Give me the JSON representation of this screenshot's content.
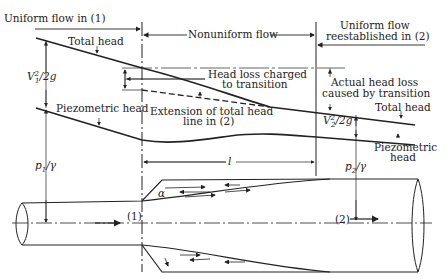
{
  "labels": {
    "uniform1": "Uniform flow in (1)",
    "nonuniform": "Nonuniform flow",
    "uniform2_line1": "Uniform flow",
    "uniform2_line2": "reestablished in (2)",
    "total_head_left": "Total head",
    "total_head_right": "Total head",
    "v1": "V",
    "v1_sup": "2",
    "v1_sub": "1",
    "v1_rest": "/2g",
    "v2": "V",
    "v2_sup": "2",
    "v2_sub": "2",
    "v2_rest": "/2g",
    "head_loss_line1": "Head loss charged",
    "head_loss_line2": "to transition",
    "actual_loss_line1": "Actual head loss",
    "actual_loss_line2": "caused by transition",
    "piezo_left": "Piezometric head",
    "piezo_right_line1": "Piezometric",
    "piezo_right_line2": "head",
    "extension_line1": "Extension of total head",
    "extension_line2": "line in (2)",
    "p1": "p",
    "p1_sub": "1",
    "p1_rest": "/γ",
    "p2": "p",
    "p2_sub": "2",
    "p2_rest": "/γ",
    "length": "l",
    "alpha": "α",
    "section1": "(1)",
    "section2": "(2)"
  }
}
